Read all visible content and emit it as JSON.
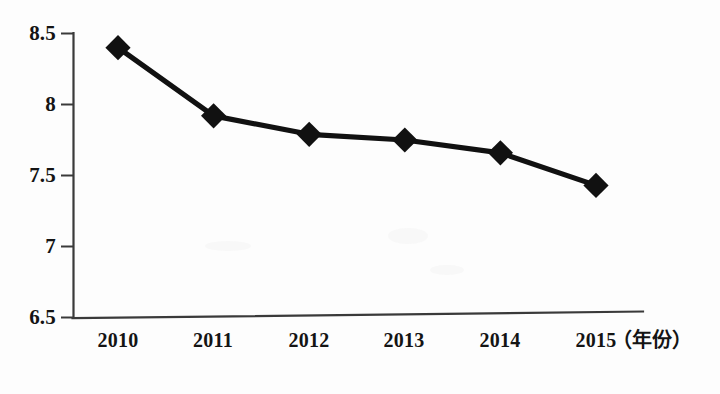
{
  "figure": {
    "background_color": "#fdfdfd",
    "ink_color": "#111111",
    "axis_color": "#3a3a3a"
  },
  "chart_data": {
    "type": "line",
    "title": "",
    "subtitle": "",
    "xlabel": "（年份）",
    "ylabel": "",
    "categories": [
      "2010",
      "2011",
      "2012",
      "2013",
      "2014",
      "2015"
    ],
    "values": [
      8.4,
      7.92,
      7.79,
      7.75,
      7.66,
      7.43
    ],
    "series": [
      {
        "name": "",
        "values": [
          8.4,
          7.92,
          7.79,
          7.75,
          7.66,
          7.43
        ]
      }
    ],
    "ylim": [
      6.5,
      8.5
    ],
    "y_ticks": [
      "6.5",
      "7",
      "7.5",
      "8",
      "8.5"
    ],
    "y_tick_values": [
      6.5,
      7,
      7.5,
      8,
      8.5
    ],
    "x_ticks": [
      "2010",
      "2011",
      "2012",
      "2013",
      "2014",
      "2015"
    ],
    "grid": false,
    "legend": "none",
    "marker": "diamond",
    "marker_color": "#111111",
    "line_color": "#111111"
  },
  "axis": {
    "y_label_0": "6.5",
    "y_label_1": "7",
    "y_label_2": "7.5",
    "y_label_3": "8",
    "y_label_4": "8.5",
    "x_label_0": "2010",
    "x_label_1": "2011",
    "x_label_2": "2012",
    "x_label_3": "2013",
    "x_label_4": "2014",
    "x_label_5": "2015",
    "x_caption": "（年份）"
  }
}
